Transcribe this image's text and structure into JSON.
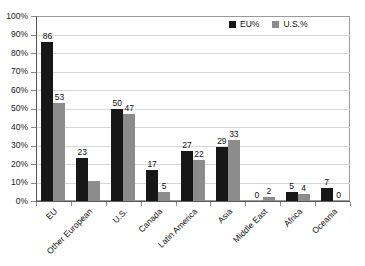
{
  "chart_data": {
    "type": "bar",
    "title": "",
    "subtitle": "",
    "xlabel": "",
    "ylabel": "",
    "ylim": [
      0,
      100
    ],
    "yticks": [
      "0%",
      "10%",
      "20%",
      "30%",
      "40%",
      "50%",
      "60%",
      "70%",
      "80%",
      "90%",
      "100%"
    ],
    "ytick_values": [
      0,
      10,
      20,
      30,
      40,
      50,
      60,
      70,
      80,
      90,
      100
    ],
    "grid": "horizontal",
    "legend_position": "top-right",
    "categories": [
      "EU",
      "Other European",
      "U.S.",
      "Canada",
      "Latin America",
      "Asia",
      "Middle East",
      "Africa",
      "Oceania"
    ],
    "series": [
      {
        "name": "EU%",
        "color": "#171717",
        "values": [
          86,
          23,
          50,
          17,
          27,
          29,
          0,
          5,
          7
        ],
        "labels": [
          "86",
          "23",
          "50",
          "17",
          "27",
          "29",
          "0",
          "5",
          "7"
        ]
      },
      {
        "name": "U.S.%",
        "color": "#8c8c8c",
        "values": [
          53,
          11,
          47,
          5,
          22,
          33,
          2,
          4,
          0
        ],
        "labels": [
          "53",
          "",
          "47",
          "5",
          "22",
          "33",
          "2",
          "4",
          "0"
        ]
      }
    ]
  },
  "legend": {
    "items": [
      {
        "label": "EU%",
        "color": "#171717"
      },
      {
        "label": "U.S.%",
        "color": "#8c8c8c"
      }
    ]
  }
}
